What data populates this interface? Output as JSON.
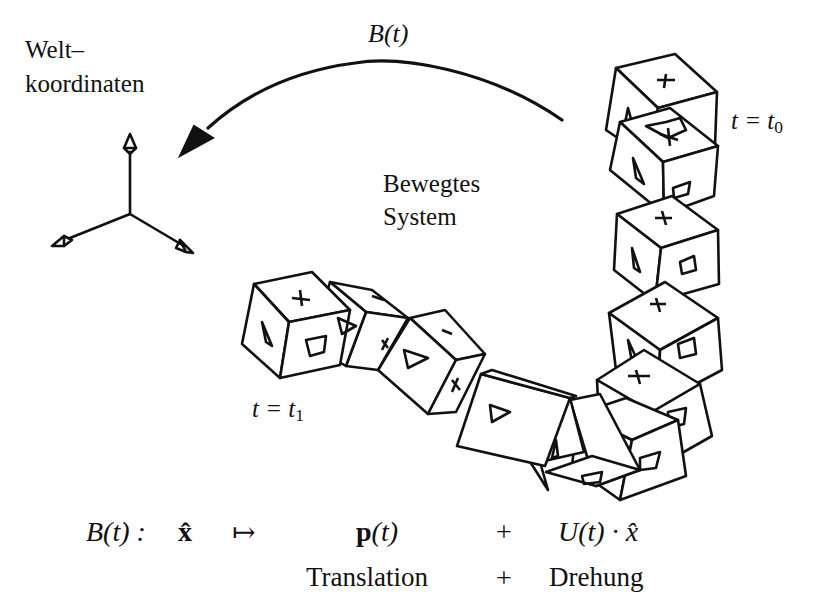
{
  "labels": {
    "world_line1": "Welt–",
    "world_line2": "koordinaten",
    "arrow_label": "B(t)",
    "moving_line1": "Bewegtes",
    "moving_line2": "System",
    "t0_prefix": "t = t",
    "t0_sub": "0",
    "t1_prefix": "t = t",
    "t1_sub": "1"
  },
  "formula": {
    "lhs": "B(t) :",
    "x_hat": "x̂",
    "maps_to": "↦",
    "translation_term": "p(t)",
    "plus": "+",
    "rotation_term": "U(t) · x̂",
    "translation_label": "Translation",
    "plus_label": "+",
    "rotation_label": "Drehung"
  },
  "icons": {
    "world_axes": "coordinate-axes-icon",
    "motion_arrow": "curved-arrow-icon",
    "cube": "cube-icon"
  },
  "colors": {
    "ink": "#111111",
    "background": "#ffffff"
  }
}
